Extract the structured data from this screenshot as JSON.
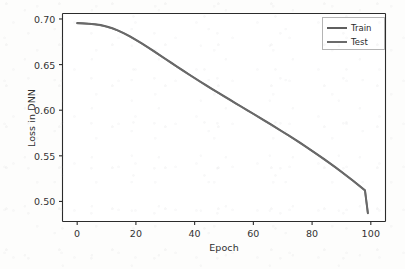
{
  "chart_data": {
    "type": "line",
    "title": "",
    "xlabel": "Epoch",
    "ylabel": "Loss in DNN",
    "xlim": [
      -5,
      105
    ],
    "ylim": [
      0.478,
      0.706
    ],
    "xticks": [
      "0",
      "20",
      "40",
      "60",
      "80",
      "100"
    ],
    "xtick_values": [
      0,
      20,
      40,
      60,
      80,
      100
    ],
    "yticks": [
      "0.70",
      "0.65",
      "0.60",
      "0.55",
      "0.50"
    ],
    "ytick_values": [
      0.7,
      0.65,
      0.6,
      0.55,
      0.5
    ],
    "grid": false,
    "legend_position": "upper right",
    "x": [
      0,
      2,
      4,
      6,
      8,
      10,
      12,
      14,
      16,
      18,
      20,
      22,
      24,
      26,
      28,
      30,
      32,
      34,
      36,
      38,
      40,
      42,
      44,
      46,
      48,
      50,
      52,
      54,
      56,
      58,
      60,
      62,
      64,
      66,
      68,
      70,
      72,
      74,
      76,
      78,
      80,
      82,
      84,
      86,
      88,
      90,
      92,
      94,
      96,
      98,
      99
    ],
    "series": [
      {
        "name": "Train",
        "color": "#5f5f5f",
        "values": [
          0.6955,
          0.6953,
          0.6949,
          0.6943,
          0.6933,
          0.6918,
          0.6898,
          0.6873,
          0.6843,
          0.6809,
          0.6772,
          0.6733,
          0.6692,
          0.665,
          0.6607,
          0.6564,
          0.6521,
          0.6478,
          0.6436,
          0.6394,
          0.6353,
          0.6312,
          0.6272,
          0.6232,
          0.6193,
          0.6154,
          0.6115,
          0.6076,
          0.6038,
          0.5999,
          0.5961,
          0.5922,
          0.5883,
          0.5844,
          0.5804,
          0.5764,
          0.5724,
          0.5683,
          0.5641,
          0.5598,
          0.5555,
          0.5511,
          0.5466,
          0.542,
          0.5373,
          0.5325,
          0.5276,
          0.5226,
          0.5175,
          0.5123,
          0.4872
        ]
      },
      {
        "name": "Test",
        "color": "#6b6b6b",
        "values": [
          0.6952,
          0.695,
          0.6946,
          0.694,
          0.693,
          0.6915,
          0.6895,
          0.687,
          0.684,
          0.6806,
          0.6769,
          0.673,
          0.6689,
          0.6647,
          0.6604,
          0.6561,
          0.6518,
          0.6475,
          0.6433,
          0.6391,
          0.635,
          0.6309,
          0.6269,
          0.6229,
          0.619,
          0.6151,
          0.6112,
          0.6073,
          0.6035,
          0.5996,
          0.5958,
          0.5919,
          0.588,
          0.5841,
          0.5801,
          0.5761,
          0.5721,
          0.568,
          0.5638,
          0.5595,
          0.5552,
          0.5508,
          0.5463,
          0.5417,
          0.537,
          0.5322,
          0.5273,
          0.5223,
          0.5172,
          0.512,
          0.4869
        ]
      }
    ]
  },
  "legend": {
    "items": [
      {
        "label": "Train"
      },
      {
        "label": "Test"
      }
    ]
  },
  "style": {
    "axis_color": "#2b2b2b",
    "text_color": "#2f2f2f",
    "plot_background": "#ffffff"
  }
}
